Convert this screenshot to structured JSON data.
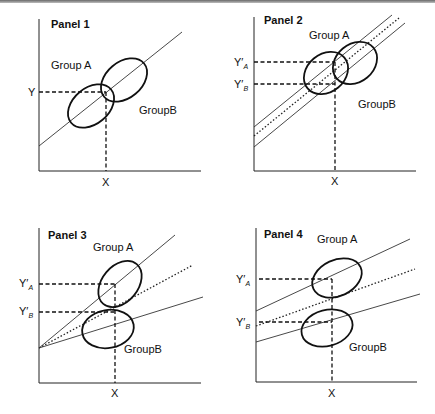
{
  "figure": {
    "panels": [
      {
        "title": "Panel 1",
        "group_a_label": "Group A",
        "group_b_label": "GroupB",
        "x_label": "X",
        "y_label": "Y",
        "description": "Single common regression line; both groups on same line"
      },
      {
        "title": "Panel 2",
        "group_a_label": "Group A",
        "group_b_label": "GroupB",
        "x_label": "X",
        "y_a_label": "Y′",
        "y_a_sub": "A",
        "y_b_label": "Y′",
        "y_b_sub": "B",
        "description": "Parallel lines with different intercepts (dotted common line between)"
      },
      {
        "title": "Panel 3",
        "group_a_label": "Group A",
        "group_b_label": "GroupB",
        "x_label": "X",
        "y_a_label": "Y′",
        "y_a_sub": "A",
        "y_b_label": "Y′",
        "y_b_sub": "B",
        "description": "Same intercept, different slopes (dotted common line between)"
      },
      {
        "title": "Panel 4",
        "group_a_label": "Group A",
        "group_b_label": "GroupB",
        "x_label": "X",
        "y_a_label": "Y′",
        "y_a_sub": "A",
        "y_b_label": "Y′",
        "y_b_sub": "B",
        "description": "Different intercepts and slopes (dotted common line between)"
      }
    ]
  }
}
